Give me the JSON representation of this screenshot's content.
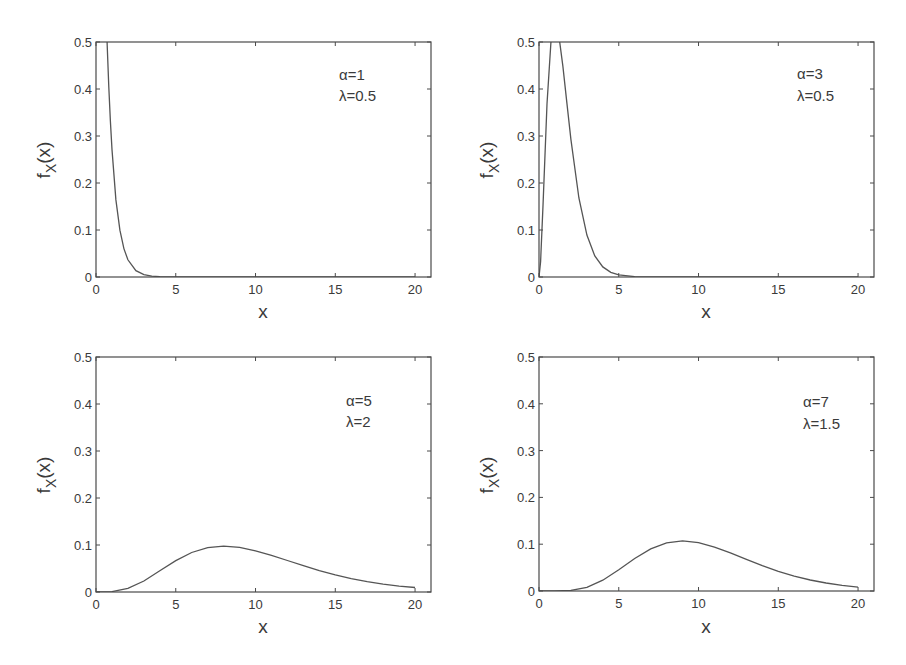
{
  "chart_data": [
    {
      "type": "line",
      "panel": "top-left",
      "title": "",
      "xlabel": "x",
      "ylabel": "f_X(x)",
      "ylabel_main": "f",
      "ylabel_sub": "X",
      "ylabel_tail": "(x)",
      "xlim": [
        0,
        21
      ],
      "ylim": [
        0,
        0.5
      ],
      "xticks": [
        0,
        5,
        10,
        15,
        20
      ],
      "yticks": [
        0,
        0.1,
        0.2,
        0.3,
        0.4,
        0.5
      ],
      "xtick_labels": [
        "0",
        "5",
        "10",
        "15",
        "20"
      ],
      "ytick_labels": [
        "0",
        "0.1",
        "0.2",
        "0.3",
        "0.4",
        "0.5"
      ],
      "grid": false,
      "annotation": [
        "α=1",
        "λ=0.5"
      ],
      "params": {
        "alpha": 1,
        "lambda": 0.5
      },
      "series": [
        {
          "name": "α=1, λ=0.5",
          "x": [
            0,
            0.25,
            0.5,
            0.6,
            0.7,
            0.8,
            0.9,
            1.0,
            1.25,
            1.5,
            1.75,
            2.0,
            2.5,
            3.0,
            3.5,
            4.0,
            5.0,
            10.0,
            15.0,
            20.0
          ],
          "y": [
            2.0,
            1.213,
            0.736,
            0.602,
            0.493,
            0.404,
            0.331,
            0.271,
            0.164,
            0.0996,
            0.0604,
            0.0366,
            0.0135,
            0.00496,
            0.00182,
            0.00067,
            9e-05,
            0,
            0,
            0
          ]
        }
      ]
    },
    {
      "type": "line",
      "panel": "top-right",
      "title": "",
      "xlabel": "x",
      "ylabel": "f_X(x)",
      "ylabel_main": "f",
      "ylabel_sub": "X",
      "ylabel_tail": "(x)",
      "xlim": [
        0,
        21
      ],
      "ylim": [
        0,
        0.5
      ],
      "xticks": [
        0,
        5,
        10,
        15,
        20
      ],
      "yticks": [
        0,
        0.1,
        0.2,
        0.3,
        0.4,
        0.5
      ],
      "xtick_labels": [
        "0",
        "5",
        "10",
        "15",
        "20"
      ],
      "ytick_labels": [
        "0",
        "0.1",
        "0.2",
        "0.3",
        "0.4",
        "0.5"
      ],
      "grid": false,
      "annotation": [
        "α=3",
        "λ=0.5"
      ],
      "params": {
        "alpha": 3,
        "lambda": 0.5
      },
      "series": [
        {
          "name": "α=3, λ=0.5",
          "x": [
            0,
            0.1,
            0.25,
            0.5,
            0.75,
            1.0,
            1.25,
            1.5,
            1.75,
            2.0,
            2.5,
            3.0,
            3.5,
            4.0,
            4.5,
            5.0,
            6.0,
            7.0,
            10.0,
            15.0,
            20.0
          ],
          "y": [
            0,
            0.0327,
            0.152,
            0.368,
            0.502,
            0.541,
            0.513,
            0.448,
            0.37,
            0.293,
            0.168,
            0.0892,
            0.0446,
            0.0215,
            0.0099,
            0.0045,
            0.00089,
            0.00016,
            0,
            0,
            0
          ]
        }
      ]
    },
    {
      "type": "line",
      "panel": "bottom-left",
      "title": "",
      "xlabel": "x",
      "ylabel": "f_X(x)",
      "ylabel_main": "f",
      "ylabel_sub": "X",
      "ylabel_tail": "(x)",
      "xlim": [
        0,
        21
      ],
      "ylim": [
        0,
        0.5
      ],
      "xticks": [
        0,
        5,
        10,
        15,
        20
      ],
      "yticks": [
        0,
        0.1,
        0.2,
        0.3,
        0.4,
        0.5
      ],
      "xtick_labels": [
        "0",
        "5",
        "10",
        "15",
        "20"
      ],
      "ytick_labels": [
        "0",
        "0.1",
        "0.2",
        "0.3",
        "0.4",
        "0.5"
      ],
      "grid": false,
      "annotation": [
        "α=5",
        "λ=2"
      ],
      "params": {
        "alpha": 5,
        "lambda": 2
      },
      "series": [
        {
          "name": "α=5, λ=2",
          "x": [
            0,
            1,
            2,
            3,
            4,
            5,
            6,
            7,
            8,
            9,
            10,
            11,
            12,
            13,
            14,
            15,
            16,
            17,
            18,
            19,
            20
          ],
          "y": [
            0,
            0.00079,
            0.00766,
            0.0235,
            0.0451,
            0.0668,
            0.084,
            0.0944,
            0.0977,
            0.0949,
            0.0877,
            0.0779,
            0.067,
            0.056,
            0.0456,
            0.0363,
            0.0285,
            0.022,
            0.0167,
            0.0125,
            0.0095
          ]
        }
      ]
    },
    {
      "type": "line",
      "panel": "bottom-right",
      "title": "",
      "xlabel": "x",
      "ylabel": "f_X(x)",
      "ylabel_main": "f",
      "ylabel_sub": "X",
      "ylabel_tail": "(x)",
      "xlim": [
        0,
        21
      ],
      "ylim": [
        0,
        0.5
      ],
      "xticks": [
        0,
        5,
        10,
        15,
        20
      ],
      "yticks": [
        0,
        0.1,
        0.2,
        0.3,
        0.4,
        0.5
      ],
      "xtick_labels": [
        "0",
        "5",
        "10",
        "15",
        "20"
      ],
      "ytick_labels": [
        "0",
        "0.1",
        "0.2",
        "0.3",
        "0.4",
        "0.5"
      ],
      "grid": false,
      "annotation": [
        "α=7",
        "λ=1.5"
      ],
      "params": {
        "alpha": 7,
        "lambda": 1.5
      },
      "series": [
        {
          "name": "α=7, λ=1.5",
          "x": [
            0,
            1,
            2,
            3,
            4,
            5,
            6,
            7,
            8,
            9,
            10,
            11,
            12,
            13,
            14,
            15,
            16,
            17,
            18,
            19,
            20
          ],
          "y": [
            0,
            4e-05,
            0.00137,
            0.008,
            0.0231,
            0.0453,
            0.0695,
            0.0899,
            0.1029,
            0.1071,
            0.1035,
            0.0939,
            0.0814,
            0.0675,
            0.0541,
            0.042,
            0.0318,
            0.0235,
            0.017,
            0.0121,
            0.0084
          ]
        }
      ]
    }
  ]
}
